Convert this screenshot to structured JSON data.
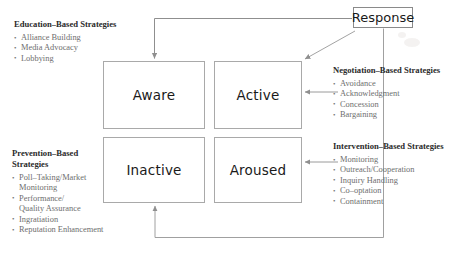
{
  "diagram": {
    "colors": {
      "box_border": "#a9a9a9",
      "connector": "#8f8f8f",
      "label_text": "#1a1a1a",
      "list_text": "#6e6e6e",
      "heading_text": "#2b2b2b",
      "background": "#ffffff"
    },
    "response_node": {
      "label": "Response"
    },
    "states": [
      {
        "id": "aware",
        "label": "Aware"
      },
      {
        "id": "active",
        "label": "Active"
      },
      {
        "id": "inactive",
        "label": "Inactive"
      },
      {
        "id": "aroused",
        "label": "Aroused"
      }
    ],
    "strategy_blocks": [
      {
        "id": "education",
        "title": "Education–Based Strategies",
        "items": [
          "Alliance Building",
          "Media Advocacy",
          "Lobbying"
        ]
      },
      {
        "id": "negotiation",
        "title": "Negotiation–Based Strategies",
        "items": [
          "Avoidance",
          "Acknowledgment",
          "Concession",
          "Bargaining"
        ]
      },
      {
        "id": "prevention",
        "title": "Prevention–Based\nStrategies",
        "items": [
          "Poll–Taking/Market\nMonitoring",
          "Performance/\nQuality Assurance",
          "Ingratiation",
          "Reputation Enhancement"
        ]
      },
      {
        "id": "intervention",
        "title": "Intervention–Based Strategies",
        "items": [
          "Monitoring",
          "Outreach/Cooperation",
          "Inquiry Handling",
          "Co–optation",
          "Containment"
        ]
      }
    ],
    "connectors": [
      {
        "id": "response-to-aware",
        "from": "Response",
        "to": "Aware",
        "style": "orthogonal-left-down",
        "arrow": true
      },
      {
        "id": "response-to-active",
        "from": "Response",
        "to": "Active",
        "style": "diagonal",
        "arrow": true
      },
      {
        "id": "response-to-inactive",
        "from": "Response",
        "to": "Inactive",
        "style": "orthogonal-down-left-up",
        "arrow": true
      },
      {
        "id": "negotiation-to-active",
        "from": "Negotiation–Based Strategies",
        "to": "Active",
        "style": "horizontal",
        "arrow": true
      },
      {
        "id": "intervention-to-aroused",
        "from": "Intervention–Based Strategies",
        "to": "Aroused",
        "style": "horizontal",
        "arrow": true
      }
    ]
  }
}
